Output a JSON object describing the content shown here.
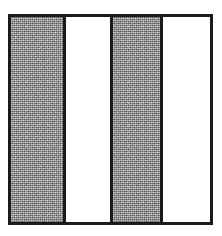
{
  "figure": {
    "background_color": "#ffffff",
    "frame": {
      "border_color": "#1b1b1b",
      "border_width_px": 3,
      "x_px": 8,
      "y_px": 14,
      "width_px": 205,
      "height_px": 211
    },
    "divider": {
      "color": "#1b1b1b",
      "width_px": 3,
      "count": 3
    },
    "band_count": 4,
    "bands": [
      {
        "index": 1,
        "fill": "gray",
        "fill_color": "#a3a3a3",
        "texture": "dithered-halftone",
        "width_px": 52,
        "width_percent": 26
      },
      {
        "index": 2,
        "fill": "white",
        "fill_color": "#ffffff",
        "texture": "none",
        "width_px": 48,
        "width_percent": 24
      },
      {
        "index": 3,
        "fill": "gray",
        "fill_color": "#a3a3a3",
        "texture": "dithered-halftone",
        "width_px": 50,
        "width_percent": 25
      },
      {
        "index": 4,
        "fill": "white",
        "fill_color": "#ffffff",
        "texture": "none",
        "width_px": 49,
        "width_percent": 25
      }
    ]
  }
}
